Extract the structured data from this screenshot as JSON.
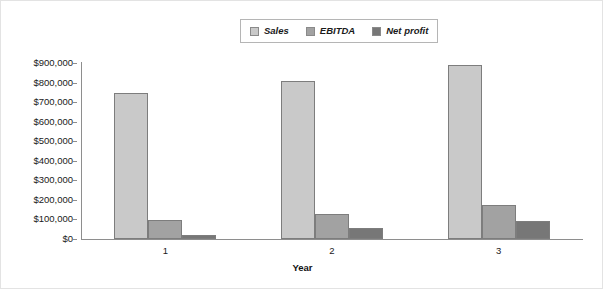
{
  "chart_data": {
    "type": "bar",
    "title": "",
    "subtitle": "",
    "xlabel": "Year",
    "ylabel": "",
    "categories": [
      "1",
      "2",
      "3"
    ],
    "series": [
      {
        "name": "Sales",
        "values": [
          745000,
          810000,
          890000
        ],
        "color": "#c9c9c9"
      },
      {
        "name": "EBITDA",
        "values": [
          95000,
          130000,
          175000
        ],
        "color": "#a2a2a2"
      },
      {
        "name": "Net profit",
        "values": [
          20000,
          55000,
          90000
        ],
        "color": "#777777"
      }
    ],
    "ylim": [
      0,
      900000
    ],
    "ytick_values": [
      0,
      100000,
      200000,
      300000,
      400000,
      500000,
      600000,
      700000,
      800000,
      900000
    ],
    "ytick_labels": [
      "$0",
      "$100,000",
      "$200,000",
      "$300,000",
      "$400,000",
      "$500,000",
      "$600,000",
      "$700,000",
      "$800,000",
      "$900,000"
    ],
    "grid": false,
    "legend_position": "top-center",
    "axis_color": "#8e8e8e",
    "bar_border_color": "#7d7d7d",
    "background": "#ffffff"
  },
  "legend": {
    "items": [
      {
        "label": "Sales",
        "color": "#c9c9c9"
      },
      {
        "label": "EBITDA",
        "color": "#a2a2a2"
      },
      {
        "label": "Net profit",
        "color": "#777777"
      }
    ]
  },
  "axes": {
    "x_title": "Year",
    "x_tick_labels": [
      "1",
      "2",
      "3"
    ],
    "y_tick_labels": [
      "$900,000",
      "$800,000",
      "$700,000",
      "$600,000",
      "$500,000",
      "$400,000",
      "$300,000",
      "$200,000",
      "$100,000",
      "$0"
    ]
  }
}
